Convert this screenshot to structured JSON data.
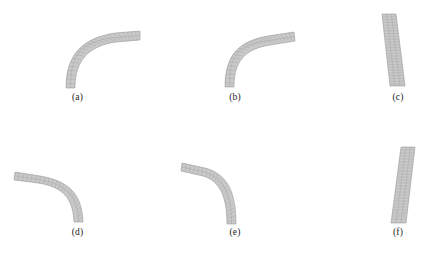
{
  "figure": {
    "background_color": "#ffffff",
    "panel_count": 6,
    "columns": 3,
    "rows": 2,
    "element_fill_color": "#c9c9c9",
    "element_edge_color": "#b0b0b0",
    "mesh_line_color": "#a8a8a8",
    "label_color": "#1b1b1b"
  },
  "panels": [
    {
      "id": "a",
      "label": "(a)",
      "label_x": 77,
      "label_y": 98,
      "shape": "curved-strip",
      "description": "mesh strip bending from lower-left up and over to the right",
      "start": [
        70,
        86
      ],
      "end": [
        136,
        33
      ],
      "thickness": 9,
      "elements_along": 26,
      "elements_across": 2,
      "bend_direction": "up-right",
      "curvature": "strong"
    },
    {
      "id": "b",
      "label": "(b)",
      "label_x": 234,
      "label_y": 98,
      "shape": "curved-strip",
      "description": "mesh strip bending from lower-left up and over to the right, tighter radius",
      "start": [
        229,
        85
      ],
      "end": [
        293,
        35
      ],
      "thickness": 9,
      "elements_along": 26,
      "elements_across": 2,
      "bend_direction": "up-right",
      "curvature": "strong"
    },
    {
      "id": "c",
      "label": "(c)",
      "label_x": 398,
      "label_y": 98,
      "shape": "near-vertical-strip",
      "description": "nearly straight vertical mesh strip leaning right toward the bottom",
      "start": [
        389,
        14
      ],
      "end": [
        399,
        86
      ],
      "thickness": 14,
      "elements_along": 26,
      "elements_across": 3,
      "bend_direction": "slight-right",
      "curvature": "slight"
    },
    {
      "id": "d",
      "label": "(d)",
      "label_x": 77,
      "label_y": 232,
      "shape": "curved-strip",
      "description": "mesh strip running from upper-left curving down to the lower-right",
      "start": [
        15,
        176
      ],
      "end": [
        84,
        221
      ],
      "thickness": 9,
      "elements_along": 26,
      "elements_across": 2,
      "bend_direction": "down-right",
      "curvature": "strong"
    },
    {
      "id": "e",
      "label": "(e)",
      "label_x": 234,
      "label_y": 232,
      "shape": "curved-strip",
      "description": "mesh strip running from upper-left curving down to the lower-right, tighter radius",
      "start": [
        182,
        166
      ],
      "end": [
        227,
        224
      ],
      "thickness": 9,
      "elements_along": 26,
      "elements_across": 2,
      "bend_direction": "down-right",
      "curvature": "strong"
    },
    {
      "id": "f",
      "label": "(f)",
      "label_x": 398,
      "label_y": 232,
      "shape": "near-vertical-strip",
      "description": "nearly straight vertical mesh strip leaning left toward the bottom",
      "start": [
        408,
        147
      ],
      "end": [
        392,
        223
      ],
      "thickness": 14,
      "elements_along": 26,
      "elements_across": 3,
      "bend_direction": "slight-left",
      "curvature": "slight"
    }
  ]
}
